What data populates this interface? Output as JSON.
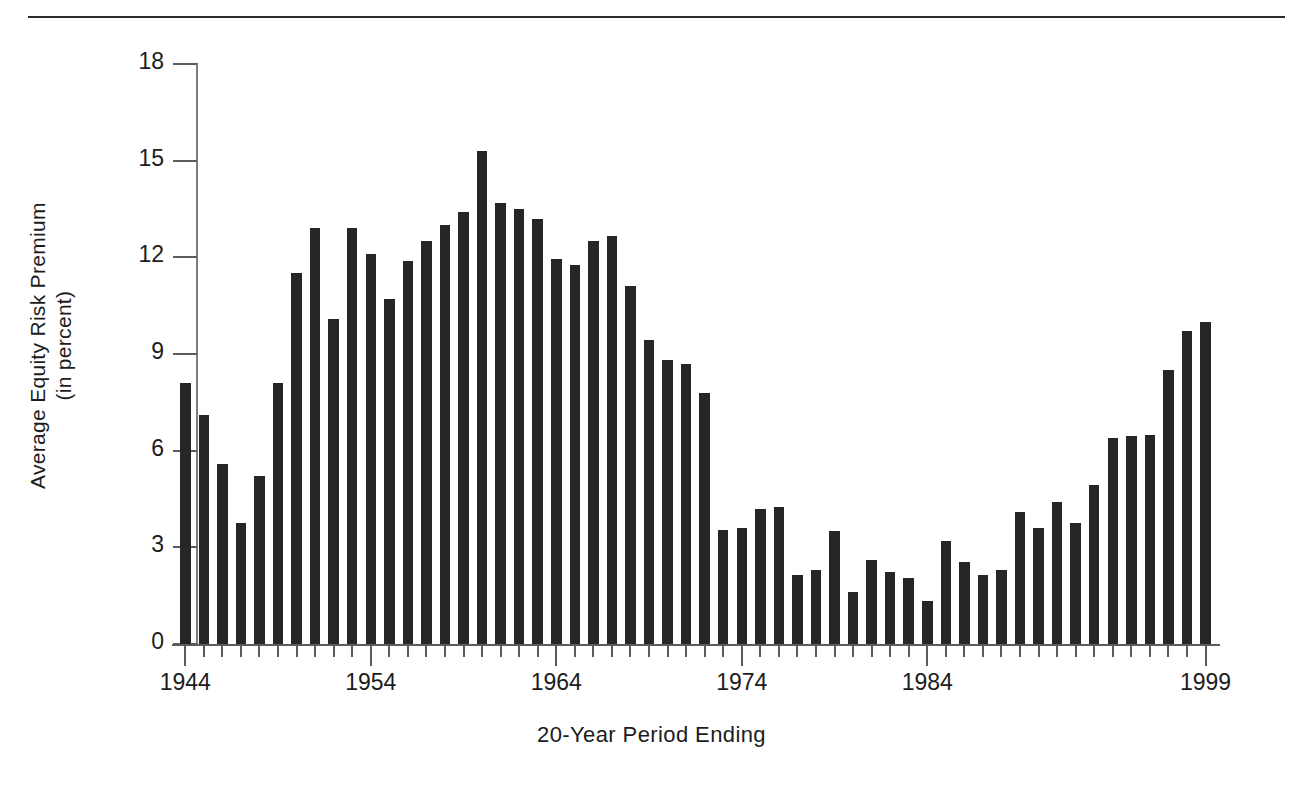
{
  "chart_data": {
    "type": "bar",
    "title": "",
    "xlabel": "20-Year Period Ending",
    "ylabel": "Average Equity Risk Premium\n(in percent)",
    "ylabel_line1": "Average Equity Risk Premium",
    "ylabel_line2": "(in percent)",
    "ylim": [
      0,
      18
    ],
    "yticks": [
      0,
      3,
      6,
      9,
      12,
      15,
      18
    ],
    "ytick_labels": [
      "0",
      "3",
      "6",
      "9",
      "12",
      "15",
      "18"
    ],
    "xlim": [
      1944,
      1999
    ],
    "xticks_major": [
      1944,
      1954,
      1964,
      1974,
      1984,
      1999
    ],
    "xtick_labels": [
      "1944",
      "1954",
      "1964",
      "1974",
      "1984",
      "1999"
    ],
    "grid": false,
    "legend": null,
    "bar_color": "#262626",
    "axis_color": "#5c5c5c",
    "categories": [
      "1944",
      "1945",
      "1946",
      "1947",
      "1948",
      "1949",
      "1950",
      "1951",
      "1952",
      "1953",
      "1954",
      "1955",
      "1956",
      "1957",
      "1958",
      "1959",
      "1960",
      "1961",
      "1962",
      "1963",
      "1964",
      "1965",
      "1966",
      "1967",
      "1968",
      "1969",
      "1970",
      "1971",
      "1972",
      "1973",
      "1974",
      "1975",
      "1976",
      "1977",
      "1978",
      "1979",
      "1980",
      "1981",
      "1982",
      "1983",
      "1984",
      "1985",
      "1986",
      "1987",
      "1988",
      "1989",
      "1990",
      "1991",
      "1992",
      "1993",
      "1994",
      "1995",
      "1996",
      "1997",
      "1998",
      "1999"
    ],
    "values": [
      8.1,
      7.1,
      5.6,
      3.75,
      5.2,
      8.1,
      11.5,
      12.9,
      10.1,
      12.9,
      12.1,
      10.7,
      11.9,
      12.5,
      13.0,
      13.4,
      15.3,
      13.7,
      13.5,
      13.2,
      11.95,
      11.75,
      12.5,
      12.65,
      11.1,
      9.45,
      8.8,
      8.7,
      7.8,
      3.55,
      3.6,
      4.2,
      4.25,
      2.15,
      2.3,
      3.5,
      1.6,
      2.6,
      2.25,
      2.05,
      1.35,
      3.2,
      2.55,
      2.15,
      2.3,
      4.1,
      3.6,
      4.4,
      3.75,
      4.95,
      6.4,
      6.45,
      6.5,
      8.5,
      9.7,
      10.0
    ]
  },
  "top_rule": {
    "visible": true
  }
}
